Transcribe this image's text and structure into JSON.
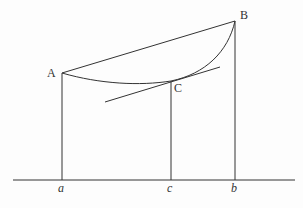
{
  "diagram": {
    "type": "geometric-figure",
    "stroke_color": "#333333",
    "points": {
      "A": {
        "label": "A",
        "x": 62,
        "y": 73
      },
      "B": {
        "label": "B",
        "x": 235,
        "y": 21
      },
      "C": {
        "label": "C",
        "x": 171,
        "y": 81
      }
    },
    "baseline": {
      "y": 180,
      "x_start": 13,
      "x_end": 295,
      "ticks": [
        {
          "label": "a",
          "x": 62
        },
        {
          "label": "c",
          "x": 171
        },
        {
          "label": "b",
          "x": 235
        }
      ]
    },
    "tangent_line": {
      "x1": 105,
      "y1": 102,
      "x2": 220,
      "y2": 67
    },
    "labels": {
      "A": "A",
      "B": "B",
      "C": "C",
      "a": "a",
      "c": "c",
      "b": "b"
    }
  }
}
